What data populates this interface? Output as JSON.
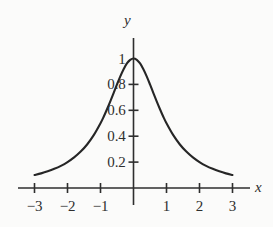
{
  "chart_data": {
    "type": "line",
    "title": "",
    "xlabel": "x",
    "ylabel": "y",
    "xlim": [
      -3.3,
      3.3
    ],
    "ylim": [
      -0.12,
      1.12
    ],
    "grid": false,
    "legend": null,
    "axis_style": "centered-cross",
    "xticks": [
      -3,
      -2,
      -1,
      1,
      2,
      3
    ],
    "xtick_labels": [
      "−3",
      "−2",
      "−1",
      "1",
      "2",
      "3"
    ],
    "yticks": [
      0.2,
      0.4,
      0.6,
      0.8,
      1
    ],
    "ytick_labels": [
      "0.2",
      "0.4",
      "0.6",
      "0.8",
      "1"
    ],
    "series": [
      {
        "name": "y = 1/(1 + x^2)",
        "color": "#262626",
        "linewidth": 2.1,
        "x": [
          -3.0,
          -2.8,
          -2.6,
          -2.4,
          -2.2,
          -2.0,
          -1.8,
          -1.6,
          -1.4,
          -1.2,
          -1.0,
          -0.9,
          -0.8,
          -0.7,
          -0.6,
          -0.5,
          -0.4,
          -0.3,
          -0.2,
          -0.1,
          0.0,
          0.1,
          0.2,
          0.3,
          0.4,
          0.5,
          0.6,
          0.7,
          0.8,
          0.9,
          1.0,
          1.2,
          1.4,
          1.6,
          1.8,
          2.0,
          2.2,
          2.4,
          2.6,
          2.8,
          3.0
        ],
        "y": [
          0.1,
          0.113,
          0.129,
          0.148,
          0.171,
          0.2,
          0.236,
          0.281,
          0.338,
          0.41,
          0.5,
          0.552,
          0.61,
          0.671,
          0.735,
          0.8,
          0.862,
          0.917,
          0.962,
          0.99,
          1.0,
          0.99,
          0.962,
          0.917,
          0.862,
          0.8,
          0.735,
          0.671,
          0.61,
          0.552,
          0.5,
          0.41,
          0.338,
          0.281,
          0.236,
          0.2,
          0.171,
          0.148,
          0.129,
          0.113,
          0.1
        ]
      }
    ]
  },
  "labels": {
    "y_axis_name": "y",
    "x_axis_name": "x"
  }
}
